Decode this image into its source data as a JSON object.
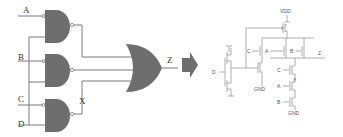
{
  "diagram": {
    "type": "logic-to-cmos-conversion",
    "colors": {
      "gate_fill": "#6e6e6e",
      "wire": "#7a7a7a",
      "transistor_wire": "#9a9a9a",
      "background": "#ffffff"
    },
    "gate_level": {
      "inputs": {
        "a": "A",
        "b": "B",
        "c": "C",
        "d": "D"
      },
      "gates": [
        {
          "id": "nand1",
          "type": "NAND",
          "inputs": [
            "A",
            "D"
          ]
        },
        {
          "id": "nand2",
          "type": "NAND",
          "inputs": [
            "B",
            "D"
          ]
        },
        {
          "id": "nand3",
          "type": "NAND",
          "inputs": [
            "C",
            "D"
          ],
          "output_label": "X"
        },
        {
          "id": "or1",
          "type": "OR",
          "inputs": [
            "nand1",
            "nand2",
            "X"
          ],
          "output_label": "Z"
        }
      ],
      "internal_node": "X",
      "output": "Z"
    },
    "arrow": "conversion-arrow",
    "transistor_level": {
      "supply": "VDD",
      "ground_1": "GND",
      "ground_2": "GND",
      "input_d": "D",
      "pmos_labels": {
        "c": "C",
        "a": "A",
        "b": "B"
      },
      "nmos_labels": {
        "c": "C",
        "a": "A",
        "b": "B"
      },
      "node_x": "X",
      "output": "Z"
    }
  }
}
